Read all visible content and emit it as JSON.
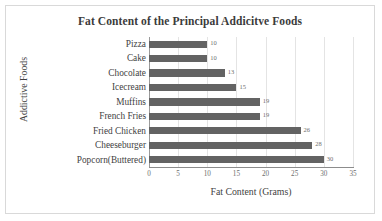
{
  "chart_data": {
    "type": "bar",
    "orientation": "horizontal",
    "title": "Fat Content of the Principal Addicitve Foods",
    "xlabel": "Fat Content (Grams)",
    "ylabel": "Addictive Foods",
    "categories": [
      "Pizza",
      "Cake",
      "Chocolate",
      "Icecream",
      "Muffins",
      "French Fries",
      "Fried Chicken",
      "Cheeseburger",
      "Popcorn(Buttered)"
    ],
    "values": [
      10,
      10,
      13,
      15,
      19,
      19,
      26,
      28,
      30
    ],
    "value_labels": [
      "10",
      "10",
      "13",
      "15",
      "19",
      "19",
      "26",
      "28",
      "30"
    ],
    "xlim": [
      0,
      35
    ],
    "xticks": [
      0,
      5,
      10,
      15,
      20,
      25,
      30,
      35
    ],
    "xtick_labels": [
      "0",
      "5",
      "10",
      "15",
      "20",
      "25",
      "30",
      "35"
    ],
    "grid": "vertical",
    "legend": null,
    "bar_color": "#636363",
    "gridline_color": "#e4e4e4",
    "axis_color": "#8c8c8c",
    "title_color": "#3b3b3b",
    "label_color": "#3f3f3f",
    "value_label_color": "#6e6e6e",
    "border_color": "#d9d9d9",
    "background": "#ffffff"
  }
}
